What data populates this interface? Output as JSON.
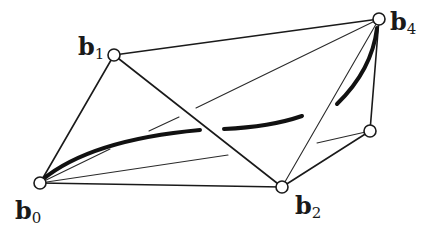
{
  "figure": {
    "points": [
      {
        "id": "b0",
        "label": "b",
        "subscript": "0",
        "x": 40,
        "y": 183
      },
      {
        "id": "b1",
        "label": "b",
        "subscript": "1",
        "x": 114,
        "y": 55
      },
      {
        "id": "b2",
        "label": "b",
        "subscript": "2",
        "x": 282,
        "y": 187
      },
      {
        "id": "b3",
        "label": "",
        "subscript": "",
        "x": 370,
        "y": 131
      },
      {
        "id": "b4",
        "label": "b",
        "subscript": "4",
        "x": 379,
        "y": 19
      }
    ],
    "labels": {
      "b0": {
        "main": "b",
        "sub": "0"
      },
      "b1": {
        "main": "b",
        "sub": "1"
      },
      "b2": {
        "main": "b",
        "sub": "2"
      },
      "b4": {
        "main": "b",
        "sub": "4"
      }
    },
    "colors": {
      "stroke": "#1a1a1a",
      "background": "#ffffff"
    }
  }
}
